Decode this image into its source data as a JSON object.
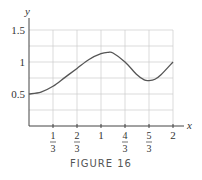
{
  "figure": {
    "caption": "FIGURE 16"
  },
  "chart_data": {
    "type": "line",
    "title": "",
    "xlabel": "x",
    "ylabel": "y",
    "x_ticks": [
      "1/3",
      "2/3",
      "1",
      "4/3",
      "5/3",
      "2"
    ],
    "y_ticks": [
      "0.5",
      "1",
      "1.5"
    ],
    "xlim": [
      0,
      2
    ],
    "ylim": [
      0,
      1.5
    ],
    "grid": true,
    "series": [
      {
        "name": "curve",
        "x": [
          0,
          0.1667,
          0.3333,
          0.5,
          0.6667,
          0.8333,
          1.0,
          1.1,
          1.1667,
          1.3333,
          1.5,
          1.6,
          1.6667,
          1.75,
          1.8333,
          2.0
        ],
        "values": [
          0.5,
          0.53,
          0.62,
          0.76,
          0.9,
          1.04,
          1.13,
          1.15,
          1.14,
          1.0,
          0.8,
          0.72,
          0.71,
          0.73,
          0.8,
          1.0
        ]
      }
    ]
  }
}
